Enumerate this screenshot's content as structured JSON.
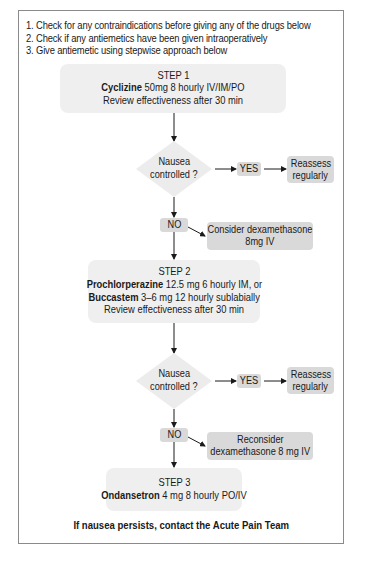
{
  "intro": {
    "items": [
      "1. Check for any contraindications before giving any of the drugs below",
      "2. Check if any antiemetics have been given intraoperatively",
      "3. Give antiemetic using stepwise approach below"
    ]
  },
  "step1": {
    "title": "STEP 1",
    "drug": "Cyclizine",
    "dose": " 50mg 8 hourly IV/IM/PO",
    "review": "Review effectiveness after 30 min"
  },
  "decision1": {
    "line1": "Nausea",
    "line2": "controlled ?",
    "yes_label": "YES",
    "yes_action_line1": "Reassess",
    "yes_action_line2": "regularly",
    "no_label": "NO",
    "no_action_line1": "Consider dexamethasone",
    "no_action_line2": "8mg IV"
  },
  "step2": {
    "title": "STEP 2",
    "drug1": "Prochlorperazine",
    "dose1": " 12.5 mg 6 hourly IM, or",
    "drug2": "Buccastem",
    "dose2": " 3–6 mg 12 hourly sublabially",
    "review": "Review effectiveness after 30 min"
  },
  "decision2": {
    "line1": "Nausea",
    "line2": "controlled ?",
    "yes_label": "YES",
    "yes_action_line1": "Reassess",
    "yes_action_line2": "regularly",
    "no_label": "NO",
    "no_action_line1": "Reconsider",
    "no_action_line2": "dexamethasone 8 mg IV"
  },
  "step3": {
    "title": "STEP 3",
    "drug": "Ondansetron",
    "dose": " 4 mg 8 hourly PO/IV"
  },
  "footer": {
    "text": "If nausea persists, contact the Acute Pain Team"
  },
  "colors": {
    "frame_border": "#8a8a8a",
    "step_box": "#efefef",
    "small_box": "#d9d9d9",
    "diamond": "#ececec",
    "arrow": "#1a1a1a"
  }
}
